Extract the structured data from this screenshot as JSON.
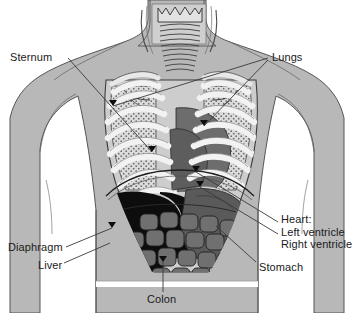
{
  "figure": {
    "background_color": "#ffffff",
    "width": 353,
    "height": 313
  },
  "palette": {
    "body_fill": "#b8b8b8",
    "body_outline": "#4a4a4a",
    "lung_field": "#d8d8d8",
    "rib_white": "#f2f2f2",
    "heart_gray": "#6e6e6e",
    "stomach_gray": "#5a5a5a",
    "liver_black": "#0d0d0d",
    "colon_gray": "#707070",
    "colon_outline": "#2a2a2a",
    "sternum_fill": "#e6e6e6",
    "leader_line": "#3a3a3a",
    "text": "#1a1a1a"
  },
  "labels": [
    {
      "id": "sternum",
      "text": "Sternum",
      "x": 10,
      "y": 51,
      "align": "left",
      "leaders": [
        [
          68,
          58,
          152,
          152
        ]
      ]
    },
    {
      "id": "lungs",
      "text": "Lungs",
      "x": 272,
      "y": 51,
      "align": "left",
      "leaders": [
        [
          268,
          58,
          113,
          106
        ],
        [
          268,
          60,
          204,
          126
        ]
      ]
    },
    {
      "id": "heart",
      "lines": [
        "Heart:",
        "Left ventricle",
        "Right ventricle"
      ],
      "x": 281,
      "y": 213,
      "align": "left",
      "leaders": [
        [
          278,
          222,
          196,
          172
        ],
        [
          278,
          234,
          200,
          187
        ]
      ]
    },
    {
      "id": "diaphragm",
      "text": "Diaphragm",
      "x": 8,
      "y": 241,
      "align": "left",
      "leaders": [
        [
          66,
          247,
          112,
          228
        ]
      ]
    },
    {
      "id": "liver",
      "text": "Liver",
      "x": 38,
      "y": 259,
      "align": "left",
      "leaders": [
        [
          64,
          263,
          110,
          243
        ]
      ]
    },
    {
      "id": "stomach",
      "text": "Stomach",
      "x": 259,
      "y": 261,
      "align": "left",
      "leaders": [
        [
          256,
          262,
          216,
          226
        ]
      ]
    },
    {
      "id": "colon",
      "text": "Colon",
      "x": 147,
      "y": 293,
      "align": "left",
      "leaders": [
        [
          163,
          292,
          163,
          262
        ]
      ]
    }
  ],
  "organs": [
    {
      "id": "sternum",
      "name": "Sternum"
    },
    {
      "id": "lungs",
      "name": "Lungs"
    },
    {
      "id": "heart",
      "name": "Heart"
    },
    {
      "id": "left-ventricle",
      "name": "Left ventricle"
    },
    {
      "id": "right-ventricle",
      "name": "Right ventricle"
    },
    {
      "id": "diaphragm",
      "name": "Diaphragm"
    },
    {
      "id": "liver",
      "name": "Liver"
    },
    {
      "id": "stomach",
      "name": "Stomach"
    },
    {
      "id": "colon",
      "name": "Colon"
    },
    {
      "id": "trachea",
      "name": "Trachea"
    },
    {
      "id": "rib-cage",
      "name": "Rib cage"
    }
  ]
}
